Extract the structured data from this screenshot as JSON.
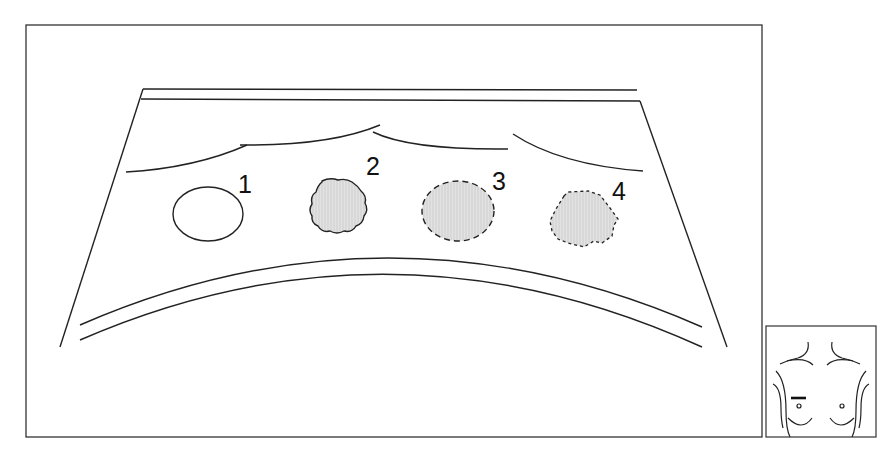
{
  "diagram": {
    "lesions": [
      {
        "label": "1",
        "type": "anechoic-circle-sharp-margin"
      },
      {
        "label": "2",
        "type": "hypoechoic-irregular-solid-margin"
      },
      {
        "label": "3",
        "type": "hypoechoic-oval-dashed-margin"
      },
      {
        "label": "4",
        "type": "hypoechoic-irregular-dotted-margin"
      }
    ],
    "body_marker": {
      "view": "chest-torso",
      "probe_position": "right-breast-upper"
    },
    "colors": {
      "line": "#222222",
      "fill": "#dcdcdc",
      "background": "#ffffff"
    }
  }
}
